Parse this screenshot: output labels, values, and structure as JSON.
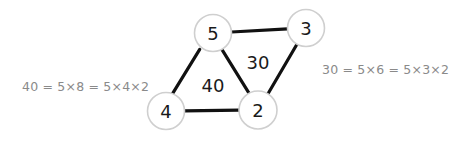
{
  "diagram": {
    "background_color": "#ffffff",
    "node_stroke_color": "#cfcfcf",
    "node_fill_color": "#ffffff",
    "edge_color": "#111111",
    "label_color": "#1a1a1a",
    "annotation_color": "#8a8a8a",
    "nodes": [
      {
        "id": "five",
        "label": "5",
        "cx": 213,
        "cy": 33,
        "r": 18.5
      },
      {
        "id": "three",
        "label": "3",
        "cx": 306,
        "cy": 28,
        "r": 18.5
      },
      {
        "id": "four",
        "label": "4",
        "cx": 166,
        "cy": 111,
        "r": 18.5
      },
      {
        "id": "two",
        "label": "2",
        "cx": 258,
        "cy": 110,
        "r": 19.0
      }
    ],
    "edges": [
      {
        "id": "edge-five-three",
        "from": "five",
        "to": "three",
        "x1": 231.5,
        "y1": 32.0,
        "x2": 287.6,
        "y2": 28.9
      },
      {
        "id": "edge-five-four",
        "from": "five",
        "to": "four",
        "x1": 199.7,
        "y1": 49.4,
        "x2": 172.1,
        "y2": 94.3
      },
      {
        "id": "edge-five-two",
        "from": "five",
        "to": "two",
        "x1": 221.7,
        "y1": 49.2,
        "x2": 249.6,
        "y2": 94.1
      },
      {
        "id": "edge-four-two",
        "from": "four",
        "to": "two",
        "x1": 184.5,
        "y1": 110.9,
        "x2": 239.0,
        "y2": 110.2
      },
      {
        "id": "edge-three-two",
        "from": "three",
        "to": "two",
        "x1": 297.1,
        "y1": 44.0,
        "x2": 268.0,
        "y2": 93.8
      }
    ],
    "edge_labels": [
      {
        "id": "label-forty",
        "text": "40",
        "x": 213,
        "y": 85
      },
      {
        "id": "label-thirty",
        "text": "30",
        "x": 258,
        "y": 62
      }
    ],
    "annotations": {
      "left": "40 = 5×8 = 5×4×2",
      "right": "30 = 5×6 = 5×3×2"
    }
  }
}
